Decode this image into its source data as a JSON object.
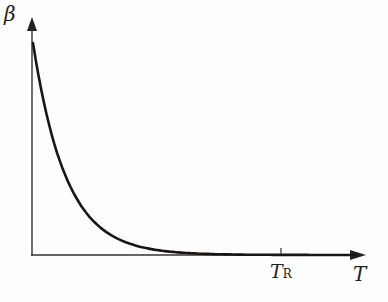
{
  "chart_data": {
    "type": "line",
    "title": "",
    "xlabel": "T",
    "ylabel": "β",
    "x_ticks": [
      {
        "label": "T",
        "subscript": "R",
        "position": "T_R"
      }
    ],
    "grid": false,
    "legend": null,
    "series": [
      {
        "name": "β(T)",
        "description": "Monotonically decaying curve from a maximum at T=0 approaching zero well before T_R",
        "x_normalized": [
          0,
          0.05,
          0.1,
          0.15,
          0.2,
          0.25,
          0.3,
          0.4,
          0.5,
          0.6,
          1.0
        ],
        "y_normalized": [
          1.0,
          0.72,
          0.5,
          0.33,
          0.2,
          0.11,
          0.05,
          0.01,
          0.0,
          0.0,
          0.0
        ]
      }
    ]
  },
  "labels": {
    "y_axis": "β",
    "x_axis": "T",
    "tick_main": "T",
    "tick_sub": "R"
  },
  "colors": {
    "axis": "#333333",
    "curve": "#1a1512"
  }
}
